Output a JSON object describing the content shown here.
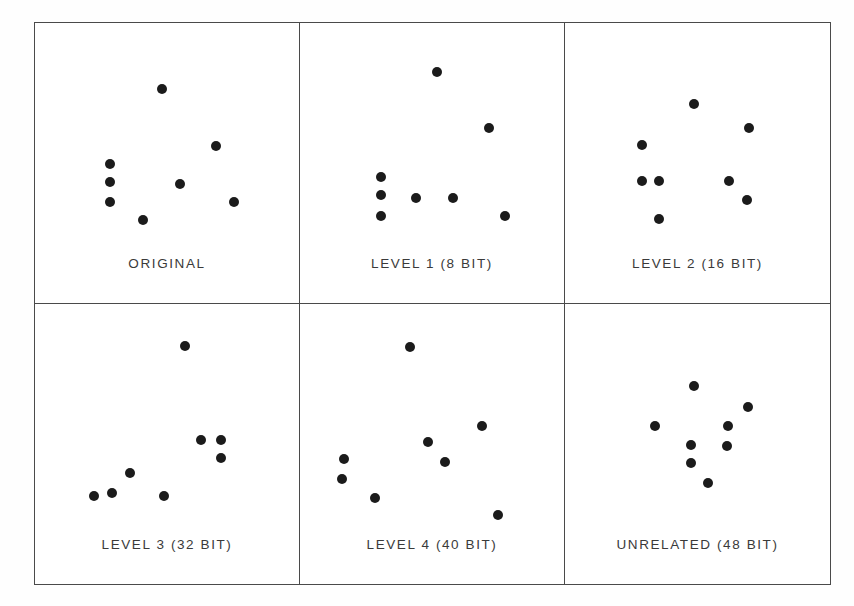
{
  "figure": {
    "background_color": "#ffffff",
    "border_color": "#4a4a4a",
    "dot_color": "#1b1b1b",
    "label_color": "#3a3a3a"
  },
  "chart_data": {
    "type": "scatter",
    "title": "",
    "xlabel": "",
    "ylabel": "",
    "grid": false,
    "legend": "none",
    "axis_ticks": "none",
    "xlim": [
      0,
      100
    ],
    "ylim": [
      0,
      100
    ],
    "note": "Six small-multiple scatter panels, each showing 8 black dots; coordinates are normalized percentages of each panel's plotting area (x left-to-right, y top-to-bottom).",
    "panels": [
      {
        "id": "original",
        "label": "ORIGINAL",
        "points": [
          {
            "x": 48.0,
            "y": 23.5
          },
          {
            "x": 68.5,
            "y": 44.0
          },
          {
            "x": 28.5,
            "y": 50.5
          },
          {
            "x": 28.5,
            "y": 57.0
          },
          {
            "x": 55.0,
            "y": 57.5
          },
          {
            "x": 28.5,
            "y": 64.0
          },
          {
            "x": 75.5,
            "y": 64.0
          },
          {
            "x": 41.0,
            "y": 70.5
          }
        ]
      },
      {
        "id": "level-1",
        "label": "LEVEL 1 (8 BIT)",
        "points": [
          {
            "x": 52.0,
            "y": 17.5
          },
          {
            "x": 71.5,
            "y": 37.5
          },
          {
            "x": 30.5,
            "y": 55.0
          },
          {
            "x": 30.5,
            "y": 61.5
          },
          {
            "x": 44.0,
            "y": 62.5
          },
          {
            "x": 58.0,
            "y": 62.5
          },
          {
            "x": 30.5,
            "y": 69.0
          },
          {
            "x": 77.5,
            "y": 69.0
          }
        ]
      },
      {
        "id": "level-2",
        "label": "LEVEL 2 (16 BIT)",
        "points": [
          {
            "x": 48.5,
            "y": 29.0
          },
          {
            "x": 69.5,
            "y": 37.5
          },
          {
            "x": 29.0,
            "y": 43.5
          },
          {
            "x": 29.0,
            "y": 56.5
          },
          {
            "x": 35.5,
            "y": 56.5
          },
          {
            "x": 62.0,
            "y": 56.5
          },
          {
            "x": 68.5,
            "y": 63.5
          },
          {
            "x": 35.5,
            "y": 70.0
          }
        ]
      },
      {
        "id": "level-3",
        "label": "LEVEL 3 (32 BIT)",
        "points": [
          {
            "x": 57.0,
            "y": 15.0
          },
          {
            "x": 63.0,
            "y": 48.5
          },
          {
            "x": 70.5,
            "y": 48.5
          },
          {
            "x": 70.5,
            "y": 55.0
          },
          {
            "x": 36.0,
            "y": 60.5
          },
          {
            "x": 29.0,
            "y": 67.5
          },
          {
            "x": 22.5,
            "y": 68.5
          },
          {
            "x": 49.0,
            "y": 68.5
          }
        ]
      },
      {
        "id": "level-4",
        "label": "LEVEL 4 (40 BIT)",
        "points": [
          {
            "x": 41.5,
            "y": 15.5
          },
          {
            "x": 69.0,
            "y": 43.5
          },
          {
            "x": 48.5,
            "y": 49.5
          },
          {
            "x": 55.0,
            "y": 56.5
          },
          {
            "x": 16.5,
            "y": 55.5
          },
          {
            "x": 16.0,
            "y": 62.5
          },
          {
            "x": 28.5,
            "y": 69.5
          },
          {
            "x": 75.0,
            "y": 75.5
          }
        ]
      },
      {
        "id": "unrelated",
        "label": "UNRELATED (48 BIT)",
        "points": [
          {
            "x": 48.5,
            "y": 29.5
          },
          {
            "x": 69.0,
            "y": 37.0
          },
          {
            "x": 34.0,
            "y": 43.5
          },
          {
            "x": 61.5,
            "y": 43.8
          },
          {
            "x": 47.5,
            "y": 50.5
          },
          {
            "x": 61.0,
            "y": 50.8
          },
          {
            "x": 47.5,
            "y": 57.0
          },
          {
            "x": 54.0,
            "y": 64.0
          }
        ]
      }
    ]
  }
}
